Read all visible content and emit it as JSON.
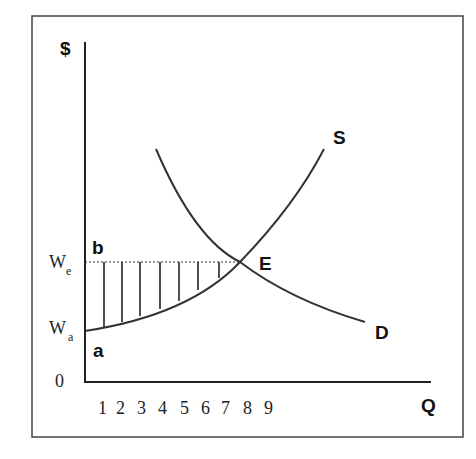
{
  "diagram": {
    "y_axis_label": "$",
    "x_axis_label": "Q",
    "origin_label": "0",
    "supply_label": "S",
    "demand_label": "D",
    "equilibrium_label": "E",
    "point_b_label": "b",
    "point_a_label": "a",
    "we_label": "W",
    "we_sub": "e",
    "wa_label": "W",
    "wa_sub": "a",
    "x_ticks": [
      "1",
      "2",
      "3",
      "4",
      "5",
      "6",
      "7",
      "8",
      "9"
    ],
    "colors": {
      "line": "#333333",
      "frame": "#444444"
    }
  }
}
